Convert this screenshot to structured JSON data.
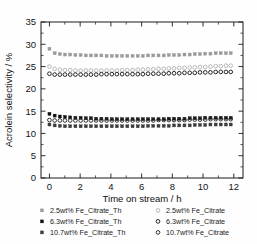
{
  "chart_data": {
    "type": "scatter",
    "title": "",
    "xlabel": "Time on stream / h",
    "ylabel": "Acrolein selectivity / %",
    "xlim": [
      -0.55,
      12.6
    ],
    "ylim": [
      0,
      35
    ],
    "xticks": [
      0,
      2,
      4,
      6,
      8,
      10,
      12
    ],
    "yticks": [
      0,
      5,
      10,
      15,
      20,
      25,
      30,
      35
    ],
    "xticklabels": [
      "0",
      "2",
      "4",
      "6",
      "8",
      "10",
      "12"
    ],
    "yticklabels": [
      "0",
      "5",
      "10",
      "15",
      "20",
      "25",
      "30",
      "35"
    ],
    "grid": false,
    "legend_position": "below",
    "x": [
      0.0,
      0.34,
      0.68,
      1.01,
      1.35,
      1.69,
      2.03,
      2.37,
      2.7,
      3.04,
      3.38,
      3.72,
      4.06,
      4.39,
      4.73,
      5.07,
      5.41,
      5.75,
      6.08,
      6.42,
      6.76,
      7.1,
      7.44,
      7.77,
      8.11,
      8.45,
      8.79,
      9.13,
      9.46,
      9.8,
      10.14,
      10.48,
      10.82,
      11.15,
      11.49,
      11.8
    ],
    "series": [
      {
        "name": "2.5wt% Fe_Citrate_Th",
        "marker": "filled-square",
        "color": "#9a9a9a",
        "values": [
          29.0,
          28.0,
          27.8,
          27.7,
          27.7,
          27.6,
          27.6,
          27.5,
          27.5,
          27.5,
          27.5,
          27.4,
          27.4,
          27.4,
          27.4,
          27.4,
          27.4,
          27.4,
          27.4,
          27.5,
          27.5,
          27.5,
          27.5,
          27.6,
          27.6,
          27.6,
          27.7,
          27.7,
          27.8,
          27.8,
          27.9,
          27.9,
          28.0,
          28.0,
          28.0,
          28.0
        ]
      },
      {
        "name": "2.5wt% Fe_Citrate",
        "marker": "open-circle",
        "color": "#b4b4b4",
        "values": [
          25.0,
          24.5,
          24.3,
          24.2,
          24.2,
          24.1,
          24.1,
          24.1,
          24.1,
          24.1,
          24.1,
          24.1,
          24.1,
          24.1,
          24.2,
          24.2,
          24.2,
          24.3,
          24.3,
          24.4,
          24.4,
          24.5,
          24.5,
          24.6,
          24.6,
          24.7,
          24.7,
          24.8,
          24.8,
          24.9,
          24.9,
          25.0,
          25.1,
          25.1,
          25.2,
          25.2
        ]
      },
      {
        "name": "6.3wt% Fe_Citrate",
        "marker": "open-circle",
        "color": "#1c1c1c",
        "values": [
          23.4,
          23.2,
          23.2,
          23.2,
          23.2,
          23.2,
          23.2,
          23.2,
          23.2,
          23.2,
          23.3,
          23.3,
          23.3,
          23.3,
          23.3,
          23.3,
          23.3,
          23.3,
          23.3,
          23.4,
          23.4,
          23.4,
          23.4,
          23.5,
          23.5,
          23.5,
          23.6,
          23.6,
          23.6,
          23.7,
          23.7,
          23.7,
          23.8,
          23.8,
          23.8,
          23.8
        ]
      },
      {
        "name": "6.3wt% Fe_Citrate_Th",
        "marker": "filled-square",
        "color": "#111111",
        "values": [
          14.4,
          14.0,
          13.8,
          13.7,
          13.6,
          13.5,
          13.5,
          13.4,
          13.4,
          13.3,
          13.3,
          13.3,
          13.2,
          13.2,
          13.2,
          13.2,
          13.2,
          13.2,
          13.2,
          13.2,
          13.2,
          13.2,
          13.2,
          13.3,
          13.3,
          13.3,
          13.3,
          13.4,
          13.4,
          13.4,
          13.5,
          13.5,
          13.5,
          13.5,
          13.5,
          13.5
        ]
      },
      {
        "name": "10.7wt% Fe_Citrate",
        "marker": "open-circle",
        "color": "#2a2a2a",
        "values": [
          13.0,
          12.9,
          12.9,
          12.9,
          12.9,
          12.9,
          12.9,
          12.9,
          12.9,
          12.9,
          12.9,
          12.9,
          12.9,
          12.9,
          12.9,
          12.9,
          12.9,
          12.9,
          12.9,
          12.9,
          12.9,
          13.0,
          13.0,
          13.0,
          13.0,
          13.0,
          13.0,
          13.1,
          13.1,
          13.1,
          13.1,
          13.2,
          13.2,
          13.2,
          13.2,
          13.2
        ]
      },
      {
        "name": "10.7wt% Fe_Citrate_Th",
        "marker": "filled-square",
        "color": "#3c3c3c",
        "values": [
          12.0,
          11.8,
          11.7,
          11.6,
          11.6,
          11.6,
          11.6,
          11.6,
          11.6,
          11.6,
          11.6,
          11.6,
          11.6,
          11.6,
          11.6,
          11.6,
          11.6,
          11.6,
          11.6,
          11.7,
          11.7,
          11.7,
          11.7,
          11.7,
          11.8,
          11.8,
          11.8,
          11.8,
          11.9,
          11.9,
          11.9,
          12.0,
          12.0,
          12.0,
          12.0,
          12.0
        ]
      }
    ]
  },
  "legend": {
    "entries": [
      {
        "label": "2.5wt% Fe_Citrate_Th",
        "marker": "filled-square",
        "color": "#9a9a9a",
        "col": 0,
        "row": 0
      },
      {
        "label": "2.5wt% Fe_Citrate",
        "marker": "open-circle",
        "color": "#b4b4b4",
        "col": 1,
        "row": 0
      },
      {
        "label": "6.3wt% Fe_Citrate_Th",
        "marker": "filled-square",
        "color": "#111111",
        "col": 0,
        "row": 1
      },
      {
        "label": "6.3wt% Fe_Citrate",
        "marker": "open-circle",
        "color": "#1c1c1c",
        "col": 1,
        "row": 1
      },
      {
        "label": "10.7wt% Fe_Citrate_Th",
        "marker": "filled-square",
        "color": "#3c3c3c",
        "col": 0,
        "row": 2
      },
      {
        "label": "10.7wt% Fe_Citrate",
        "marker": "open-circle",
        "color": "#2a2a2a",
        "col": 1,
        "row": 2
      }
    ]
  }
}
